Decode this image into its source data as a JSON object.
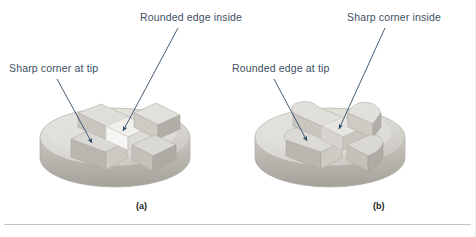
{
  "figure": {
    "title_present": false,
    "background_color": "#ffffff",
    "divider_color": "#bfc5cb",
    "label_color": "#3d4f63",
    "caption_color": "#231f20",
    "leader_line_color": "#2d4a66"
  },
  "material": {
    "name": "stone-gray-part",
    "top_face_color": "#dedcd6",
    "top_face_highlight": "#ebe9e4",
    "side_face_color": "#bfbcb6",
    "side_face_dark": "#a9a6a0",
    "inner_face_color": "#cfccc6",
    "bright_face_color": "#f2f1ee",
    "outline_color": "#b3b0aa"
  },
  "panels": [
    {
      "id": "panel-a",
      "caption": "(a)",
      "part_description": "cylindrical disc with cross-shaped boss having sharp square tips and rounded inside fillets",
      "callouts": [
        {
          "id": "callout-a-rounded-edge-inside",
          "text": "Rounded edge inside",
          "anchor": "top",
          "arrow_from": [
            178,
            28
          ],
          "arrow_to": [
            123,
            131
          ]
        },
        {
          "id": "callout-a-sharp-corner-at-tip",
          "text": "Sharp corner at tip",
          "anchor": "left",
          "arrow_from": [
            57,
            79
          ],
          "arrow_to": [
            92,
            143
          ]
        }
      ]
    },
    {
      "id": "panel-b",
      "caption": "(b)",
      "part_description": "cylindrical disc with cross-shaped boss having rounded tips and sharp inside corners",
      "callouts": [
        {
          "id": "callout-b-sharp-corner-inside",
          "text": "Sharp corner inside",
          "anchor": "top",
          "arrow_from": [
            385,
            28
          ],
          "arrow_to": [
            339,
            129
          ]
        },
        {
          "id": "callout-b-rounded-edge-at-tip",
          "text": "Rounded edge at tip",
          "anchor": "left",
          "arrow_from": [
            274,
            79
          ],
          "arrow_to": [
            307,
            141
          ]
        }
      ]
    }
  ]
}
